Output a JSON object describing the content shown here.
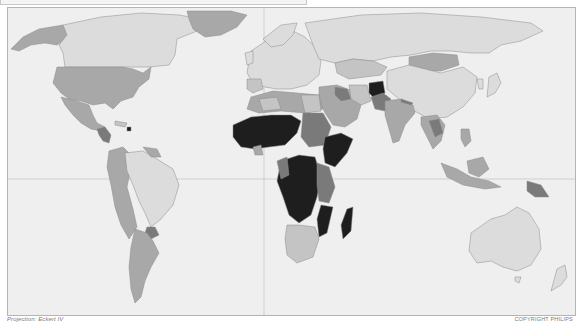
{
  "map": {
    "projection_label": "Projection: Eckert IV",
    "copyright": "COPYRIGHT PHILIPS",
    "graticule": {
      "equator": true,
      "prime_meridian": true
    },
    "colors": {
      "ocean": "#efefef",
      "border": "#8a8a8a",
      "class1_lightest": "#dcdcdc",
      "class2_light": "#c4c4c4",
      "class3_medium": "#a8a8a8",
      "class4_dark": "#7a7a7a",
      "class5_darkest": "#1e1e1e"
    },
    "regions": [
      {
        "name": "Canada",
        "class": 1
      },
      {
        "name": "Alaska",
        "class": 3
      },
      {
        "name": "United States",
        "class": 3
      },
      {
        "name": "Greenland",
        "class": 3
      },
      {
        "name": "Mexico",
        "class": 3
      },
      {
        "name": "Central America",
        "class": 4
      },
      {
        "name": "Haiti",
        "class": 5
      },
      {
        "name": "Brazil",
        "class": 1
      },
      {
        "name": "Andean South America",
        "class": 3
      },
      {
        "name": "Argentina",
        "class": 3
      },
      {
        "name": "Paraguay",
        "class": 4
      },
      {
        "name": "Europe",
        "class": 1
      },
      {
        "name": "Russia",
        "class": 1
      },
      {
        "name": "Kazakhstan",
        "class": 2
      },
      {
        "name": "Mongolia",
        "class": 3
      },
      {
        "name": "China",
        "class": 1
      },
      {
        "name": "Afghanistan",
        "class": 5
      },
      {
        "name": "Pakistan",
        "class": 4
      },
      {
        "name": "India",
        "class": 3
      },
      {
        "name": "Middle East",
        "class": 3
      },
      {
        "name": "Iraq",
        "class": 4
      },
      {
        "name": "North Africa",
        "class": 3
      },
      {
        "name": "Sahel & West Africa",
        "class": 5
      },
      {
        "name": "Sudan",
        "class": 4
      },
      {
        "name": "Horn of Africa",
        "class": 5
      },
      {
        "name": "Central Africa",
        "class": 5
      },
      {
        "name": "East Africa",
        "class": 4
      },
      {
        "name": "Southern Africa",
        "class": 2
      },
      {
        "name": "Mozambique",
        "class": 5
      },
      {
        "name": "Madagascar",
        "class": 5
      },
      {
        "name": "Southeast Asia",
        "class": 3
      },
      {
        "name": "Laos/Cambodia",
        "class": 4
      },
      {
        "name": "Indonesia",
        "class": 3
      },
      {
        "name": "Papua New Guinea",
        "class": 4
      },
      {
        "name": "Australia",
        "class": 1
      },
      {
        "name": "New Zealand",
        "class": 1
      },
      {
        "name": "Japan",
        "class": 1
      }
    ]
  }
}
